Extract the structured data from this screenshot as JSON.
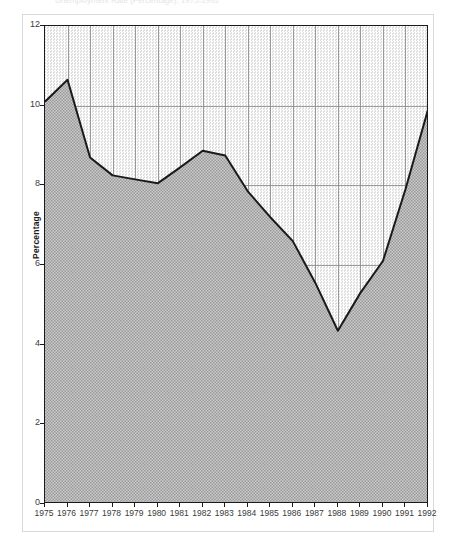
{
  "figure": {
    "title_faint": "Unemployment Rate (Percentage), 1975-1992",
    "ylabel": "Percentage"
  },
  "chart_data": {
    "type": "area",
    "title": "",
    "xlabel": "",
    "ylabel": "Percentage",
    "xlim": [
      1975,
      1992
    ],
    "ylim": [
      0,
      12
    ],
    "yticks": [
      0,
      2,
      4,
      6,
      8,
      10,
      12
    ],
    "grid": true,
    "legend": "none",
    "fill": "hatched-gray",
    "line_color": "#1a1a1a",
    "categories": [
      "1975",
      "1976",
      "1977",
      "1978",
      "1979",
      "1980",
      "1981",
      "1982",
      "1983",
      "1984",
      "1985",
      "1986",
      "1987",
      "1988",
      "1989",
      "1990",
      "1991",
      "1992"
    ],
    "values": [
      10.1,
      10.65,
      8.7,
      8.25,
      8.15,
      8.05,
      8.45,
      8.87,
      8.75,
      7.85,
      7.2,
      6.6,
      5.55,
      4.35,
      5.3,
      6.1,
      7.9,
      9.9
    ]
  },
  "colors": {
    "line": "#1a1a1a",
    "grid": "#8c8c8c",
    "fill_lower": "#b0b0b0",
    "fill_upper": "#e2e2e2",
    "axis_text": "#3a3a3a",
    "frame": "#d9d9d9"
  }
}
